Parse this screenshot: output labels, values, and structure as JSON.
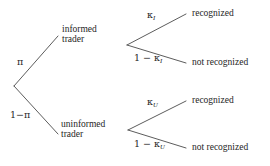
{
  "diagram": {
    "type": "decision-tree",
    "title": "",
    "root": {
      "name": "root-node"
    },
    "branches": {
      "pi": "π",
      "one_minus_pi": "1−π",
      "kappa_I": "κ",
      "kappa_I_sub": "I",
      "one_minus_kappa_I_prefix": "1 − κ",
      "one_minus_kappa_I_sub": "I",
      "kappa_U": "κ",
      "kappa_U_sub": "U",
      "one_minus_kappa_U_prefix": "1 − κ",
      "one_minus_kappa_U_sub": "U"
    },
    "nodes": {
      "informed_line1": "informed",
      "informed_line2": "trader",
      "uninformed_line1": "uninformed",
      "uninformed_line2": "trader"
    },
    "outcomes": {
      "informed_recognized": "recognized",
      "informed_not_recognized": "not recognized",
      "uninformed_recognized": "recognized",
      "uninformed_not_recognized": "not recognized"
    },
    "colors": {
      "background": "#ffffff",
      "text": "#262626",
      "line": "#4a4a4a"
    }
  }
}
